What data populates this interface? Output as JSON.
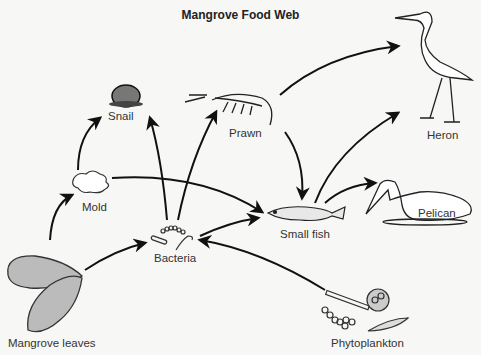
{
  "title": "Mangrove Food Web",
  "organisms": {
    "snail": "Snail",
    "prawn": "Prawn",
    "heron": "Heron",
    "mold": "Mold",
    "pelican": "Pelican",
    "small_fish": "Small fish",
    "bacteria": "Bacteria",
    "mangrove_leaves": "Mangrove leaves",
    "phytoplankton": "Phytoplankton"
  },
  "arrows": [
    {
      "from": "Mangrove leaves",
      "to": "Mold"
    },
    {
      "from": "Mangrove leaves",
      "to": "Bacteria"
    },
    {
      "from": "Mold",
      "to": "Snail"
    },
    {
      "from": "Mold",
      "to": "Small fish"
    },
    {
      "from": "Bacteria",
      "to": "Snail"
    },
    {
      "from": "Bacteria",
      "to": "Prawn"
    },
    {
      "from": "Bacteria",
      "to": "Small fish"
    },
    {
      "from": "Phytoplankton",
      "to": "Bacteria"
    },
    {
      "from": "Prawn",
      "to": "Heron"
    },
    {
      "from": "Prawn",
      "to": "Small fish"
    },
    {
      "from": "Small fish",
      "to": "Heron"
    },
    {
      "from": "Small fish",
      "to": "Pelican"
    }
  ]
}
